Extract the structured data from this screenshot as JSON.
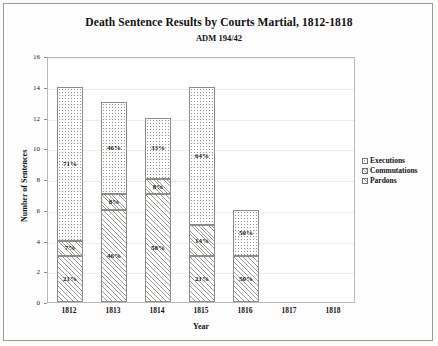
{
  "chart_data": {
    "type": "bar",
    "subtype": "stacked-bar",
    "title": "Death Sentence Results by Courts Martial, 1812-1818",
    "subtitle": "ADM 194/42",
    "xlabel": "Year",
    "ylabel": "Number of Sentences",
    "ylim": [
      0,
      16
    ],
    "yticks": [
      0,
      2,
      4,
      6,
      8,
      10,
      12,
      14,
      16
    ],
    "categories": [
      "1812",
      "1813",
      "1814",
      "1815",
      "1816",
      "1817",
      "1818"
    ],
    "grid": true,
    "legend_position": "right",
    "stack_order_bottom_to_top": [
      "Pardons",
      "Commutations",
      "Executions"
    ],
    "series": [
      {
        "name": "Executions",
        "fill": "dotted",
        "values": [
          10,
          6,
          4,
          9,
          3,
          0,
          0
        ],
        "labels": [
          "71%",
          "46%",
          "33%",
          "64%",
          "50%",
          "",
          ""
        ]
      },
      {
        "name": "Commutations",
        "fill": "fine-diagonal-hatch",
        "values": [
          1,
          1,
          1,
          2,
          0,
          0,
          0
        ],
        "labels": [
          "7%",
          "8%",
          "8%",
          "14%",
          "",
          "",
          ""
        ]
      },
      {
        "name": "Pardons",
        "fill": "diagonal-hatch",
        "values": [
          3,
          6,
          7,
          3,
          3,
          0,
          0
        ],
        "labels": [
          "21%",
          "46%",
          "58%",
          "21%",
          "50%",
          "",
          ""
        ]
      }
    ],
    "totals": [
      14,
      13,
      12,
      14,
      6,
      0,
      0
    ]
  },
  "legend": {
    "items": [
      {
        "label": "Executions"
      },
      {
        "label": "Commutations"
      },
      {
        "label": "Pardons"
      }
    ]
  },
  "colors": {
    "frame": "#9a9a96",
    "grid": "#ececec",
    "bar_outline": "#8d8d88",
    "text": "#111111"
  }
}
